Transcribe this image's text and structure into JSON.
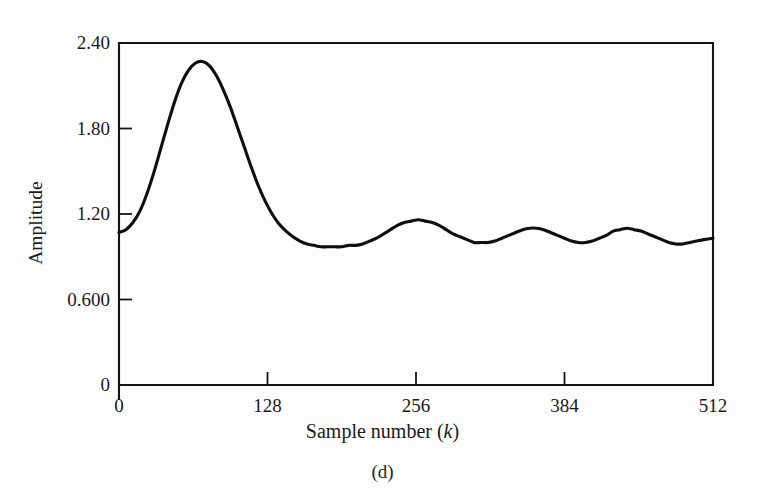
{
  "figure": {
    "caption": "(d)",
    "background": "#fdfdfd",
    "line_color": "#100f0f",
    "axis_color": "#141414"
  },
  "chart_data": {
    "type": "line",
    "title": "",
    "subtitle": "",
    "xlabel_prefix": "Sample number (",
    "xlabel_italic": "k",
    "xlabel_suffix": ")",
    "xlabel": "Sample number (k)",
    "ylabel": "Amplitude",
    "xlim": [
      0,
      512
    ],
    "ylim": [
      0,
      2.4
    ],
    "grid": false,
    "legend": null,
    "xticks": [
      0,
      128,
      256,
      384,
      512
    ],
    "xticklabels": [
      "0",
      "128",
      "256",
      "384",
      "512"
    ],
    "yticks": [
      0,
      0.6,
      1.2,
      1.8,
      2.4
    ],
    "yticklabels": [
      "0",
      "0.600",
      "1.20",
      "1.80",
      "2.40"
    ],
    "series": [
      {
        "name": "amplitude",
        "x": [
          0,
          6,
          12,
          18,
          24,
          30,
          36,
          42,
          48,
          54,
          60,
          66,
          72,
          78,
          84,
          90,
          96,
          102,
          108,
          114,
          120,
          126,
          132,
          138,
          144,
          150,
          156,
          162,
          168,
          174,
          180,
          186,
          192,
          198,
          204,
          210,
          216,
          222,
          228,
          234,
          240,
          246,
          252,
          258,
          264,
          270,
          276,
          282,
          288,
          294,
          300,
          306,
          312,
          318,
          324,
          330,
          336,
          342,
          348,
          354,
          360,
          366,
          372,
          378,
          384,
          390,
          396,
          402,
          408,
          414,
          420,
          426,
          432,
          438,
          444,
          450,
          456,
          462,
          468,
          474,
          480,
          486,
          492,
          498,
          504,
          512
        ],
        "y": [
          1.07,
          1.09,
          1.14,
          1.22,
          1.34,
          1.49,
          1.66,
          1.83,
          1.99,
          2.12,
          2.21,
          2.26,
          2.27,
          2.24,
          2.17,
          2.07,
          1.95,
          1.81,
          1.67,
          1.53,
          1.4,
          1.29,
          1.2,
          1.13,
          1.08,
          1.04,
          1.01,
          0.99,
          0.98,
          0.97,
          0.97,
          0.97,
          0.97,
          0.98,
          0.98,
          0.99,
          1.01,
          1.03,
          1.06,
          1.09,
          1.12,
          1.14,
          1.15,
          1.16,
          1.15,
          1.14,
          1.12,
          1.09,
          1.06,
          1.04,
          1.02,
          1.0,
          1.0,
          1.0,
          1.01,
          1.03,
          1.05,
          1.07,
          1.09,
          1.1,
          1.1,
          1.09,
          1.07,
          1.05,
          1.03,
          1.01,
          1.0,
          1.0,
          1.01,
          1.03,
          1.05,
          1.08,
          1.09,
          1.1,
          1.09,
          1.08,
          1.06,
          1.04,
          1.02,
          1.0,
          0.99,
          0.99,
          1.0,
          1.01,
          1.02,
          1.03
        ]
      }
    ],
    "annotations": []
  }
}
